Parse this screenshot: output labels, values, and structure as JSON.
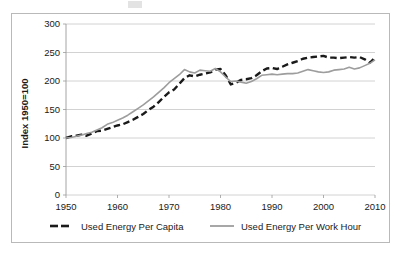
{
  "figure": {
    "background_color": "#ffffff",
    "frame_color": "#b9b9b9"
  },
  "chart_data": {
    "type": "line",
    "title": "",
    "xlabel": "",
    "ylabel": "Index 1950=100",
    "xlim": [
      1950,
      2010
    ],
    "ylim": [
      0,
      300
    ],
    "ytick_labels": [
      "0",
      "50",
      "100",
      "150",
      "200",
      "250",
      "300"
    ],
    "yticks": [
      0,
      50,
      100,
      150,
      200,
      250,
      300
    ],
    "xtick_labels": [
      "1950",
      "1960",
      "1970",
      "1980",
      "1990",
      "2000",
      "2010"
    ],
    "xticks": [
      1950,
      1960,
      1970,
      1980,
      1990,
      2000,
      2010
    ],
    "grid": "horizontal",
    "legend_position": "bottom",
    "x": [
      1950,
      1951,
      1952,
      1953,
      1954,
      1955,
      1956,
      1957,
      1958,
      1959,
      1960,
      1961,
      1962,
      1963,
      1964,
      1965,
      1966,
      1967,
      1968,
      1969,
      1970,
      1971,
      1972,
      1973,
      1974,
      1975,
      1976,
      1977,
      1978,
      1979,
      1980,
      1981,
      1982,
      1983,
      1984,
      1985,
      1986,
      1987,
      1988,
      1989,
      1990,
      1991,
      1992,
      1993,
      1994,
      1995,
      1996,
      1997,
      1998,
      1999,
      2000,
      2001,
      2002,
      2003,
      2004,
      2005,
      2006,
      2007,
      2008,
      2009,
      2010
    ],
    "series": [
      {
        "name": "Used Energy Per Capita",
        "color": "#1a1a1a",
        "style": "dashed",
        "width": 2.4,
        "values": [
          100,
          103,
          104,
          106,
          104,
          108,
          112,
          113,
          116,
          119,
          122,
          124,
          128,
          132,
          137,
          142,
          149,
          155,
          163,
          172,
          180,
          185,
          195,
          205,
          210,
          208,
          211,
          213,
          215,
          220,
          221,
          210,
          194,
          197,
          202,
          203,
          205,
          210,
          217,
          222,
          223,
          221,
          225,
          229,
          232,
          235,
          239,
          241,
          242,
          243,
          244,
          241,
          241,
          240,
          241,
          242,
          241,
          242,
          238,
          232,
          241
        ]
      },
      {
        "name": "Used Energy Per Work Hour",
        "color": "#9d9d9d",
        "style": "solid",
        "width": 1.6,
        "values": [
          100,
          101,
          103,
          105,
          108,
          110,
          114,
          118,
          124,
          127,
          131,
          135,
          140,
          146,
          152,
          158,
          165,
          172,
          180,
          188,
          197,
          204,
          211,
          220,
          216,
          214,
          219,
          218,
          217,
          222,
          216,
          207,
          199,
          200,
          198,
          196,
          199,
          204,
          210,
          211,
          212,
          211,
          212,
          213,
          213,
          214,
          217,
          220,
          218,
          216,
          215,
          216,
          219,
          220,
          221,
          224,
          221,
          223,
          227,
          231,
          237
        ]
      }
    ]
  },
  "legend": {
    "items": [
      {
        "label": "Used Energy Per Capita",
        "color": "#1a1a1a",
        "style": "dashed"
      },
      {
        "label": "Used Energy Per Work Hour",
        "color": "#9d9d9d",
        "style": "solid"
      }
    ]
  }
}
